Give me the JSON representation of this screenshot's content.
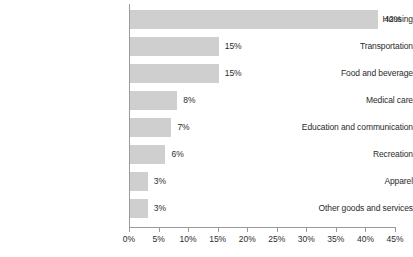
{
  "chart_data": {
    "type": "bar",
    "orientation": "horizontal",
    "title": "",
    "subtitle": "",
    "xlabel": "",
    "ylabel": "",
    "xlim": [
      0,
      45
    ],
    "grid": false,
    "legend": null,
    "bar_color": "#cfcfcf",
    "axis_color": "#9a9a9a",
    "text_color": "#2b2b2b",
    "tick_labels": [
      "0%",
      "5%",
      "10%",
      "15%",
      "20%",
      "25%",
      "30%",
      "35%",
      "40%",
      "45%"
    ],
    "tick_values": [
      0,
      5,
      10,
      15,
      20,
      25,
      30,
      35,
      40,
      45
    ],
    "categories": [
      "Housing",
      "Transportation",
      "Food and beverage",
      "Medical care",
      "Education and communication",
      "Recreation",
      "Apparel",
      "Other goods and services"
    ],
    "values": [
      42,
      15,
      15,
      8,
      7,
      6,
      3,
      3
    ],
    "value_labels": [
      "42%",
      "15%",
      "15%",
      "8%",
      "7%",
      "6%",
      "3%",
      "3%"
    ]
  }
}
